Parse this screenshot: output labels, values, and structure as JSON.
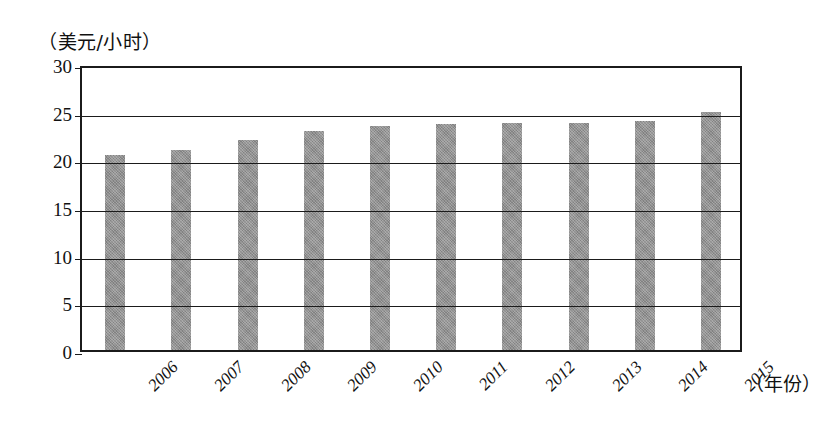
{
  "chart_data": {
    "type": "bar",
    "title": "",
    "xlabel": "（年份）",
    "ylabel": "（美元/小时）",
    "categories": [
      "2006",
      "2007",
      "2008",
      "2009",
      "2010",
      "2011",
      "2012",
      "2013",
      "2014",
      "2015"
    ],
    "values": [
      20.5,
      21.0,
      22.0,
      23.0,
      23.5,
      23.7,
      23.8,
      23.8,
      24.0,
      25.0
    ],
    "series": [
      {
        "name": "平均时薪",
        "values": [
          20.5,
          21.0,
          22.0,
          23.0,
          23.5,
          23.7,
          23.8,
          23.8,
          24.0,
          25.0
        ]
      }
    ],
    "ylim": [
      0,
      30
    ],
    "yticks": [
      0,
      5,
      10,
      15,
      20,
      25,
      30
    ],
    "ytick_labels": [
      "0",
      "5",
      "10",
      "15",
      "20",
      "25",
      "30"
    ],
    "grid": true,
    "grid_axis": "y",
    "legend": false,
    "legend_position": "none",
    "bar_color": "#8e8e8e",
    "axis_color": "#1b1b1b",
    "background_color": "#ffffff"
  },
  "axes": {
    "y_unit_caption": "（美元/小时）",
    "x_unit_caption": "（年份）"
  }
}
